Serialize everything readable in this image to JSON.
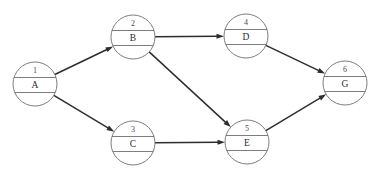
{
  "diagram": {
    "background_color": "#ffffff",
    "node_stroke_color": "#6e6e6e",
    "edge_color": "#2e2e2e",
    "text_color": "#2b2b2b",
    "node_radius": 22,
    "nodes": [
      {
        "id": "A",
        "number": "1",
        "label": "A",
        "cx": 35,
        "cy": 84
      },
      {
        "id": "B",
        "number": "2",
        "label": "B",
        "cx": 133,
        "cy": 37
      },
      {
        "id": "C",
        "number": "3",
        "label": "C",
        "cx": 133,
        "cy": 143
      },
      {
        "id": "D",
        "number": "4",
        "label": "D",
        "cx": 246,
        "cy": 36
      },
      {
        "id": "E",
        "number": "5",
        "label": "E",
        "cx": 247,
        "cy": 142
      },
      {
        "id": "G",
        "number": "6",
        "label": "G",
        "cx": 345,
        "cy": 83
      }
    ],
    "edges": [
      {
        "id": "A-B",
        "from": "A",
        "to": "B",
        "directed": true
      },
      {
        "id": "A-C",
        "from": "A",
        "to": "C",
        "directed": true
      },
      {
        "id": "B-D",
        "from": "B",
        "to": "D",
        "directed": true
      },
      {
        "id": "B-E",
        "from": "B",
        "to": "E",
        "directed": true
      },
      {
        "id": "C-E",
        "from": "C",
        "to": "E",
        "directed": true
      },
      {
        "id": "D-G",
        "from": "D",
        "to": "G",
        "directed": true
      },
      {
        "id": "E-G",
        "from": "E",
        "to": "G",
        "directed": true
      }
    ]
  }
}
